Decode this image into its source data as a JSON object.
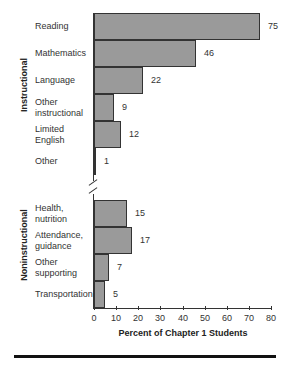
{
  "chart_data": {
    "type": "bar",
    "orientation": "horizontal",
    "xlabel": "Percent of Chapter 1 Students",
    "ylabel": "",
    "xlim": [
      0,
      80
    ],
    "xticks": [
      0,
      10,
      20,
      30,
      40,
      50,
      60,
      70,
      80
    ],
    "groups": [
      {
        "name": "Instructional",
        "categories": [
          "Reading",
          "Mathematics",
          "Language",
          "Other instructional",
          "Limited English",
          "Other"
        ],
        "values": [
          75,
          46,
          22,
          9,
          12,
          1
        ]
      },
      {
        "name": "Noninstructional",
        "categories": [
          "Health, nutrition",
          "Attendance, guidance",
          "Other supporting",
          "Transportation"
        ],
        "values": [
          15,
          17,
          7,
          5
        ]
      }
    ],
    "axis_break": true,
    "grid": false
  },
  "labels": {
    "group1": "Instructional",
    "group2": "Noninstructional",
    "xlabel": "Percent of Chapter 1 Students",
    "bars": [
      {
        "l1": "Reading",
        "l2": "",
        "v": "75"
      },
      {
        "l1": "Mathematics",
        "l2": "",
        "v": "46"
      },
      {
        "l1": "Language",
        "l2": "",
        "v": "22"
      },
      {
        "l1": "Other",
        "l2": "instructional",
        "v": "9"
      },
      {
        "l1": "Limited",
        "l2": "English",
        "v": "12"
      },
      {
        "l1": "Other",
        "l2": "",
        "v": "1"
      },
      {
        "l1": "Health,",
        "l2": "nutrition",
        "v": "15"
      },
      {
        "l1": "Attendance,",
        "l2": "guidance",
        "v": "17"
      },
      {
        "l1": "Other",
        "l2": "supporting",
        "v": "7"
      },
      {
        "l1": "Transportation",
        "l2": "",
        "v": "5"
      }
    ],
    "ticks": [
      "0",
      "10",
      "20",
      "30",
      "40",
      "50",
      "60",
      "70",
      "80"
    ]
  }
}
